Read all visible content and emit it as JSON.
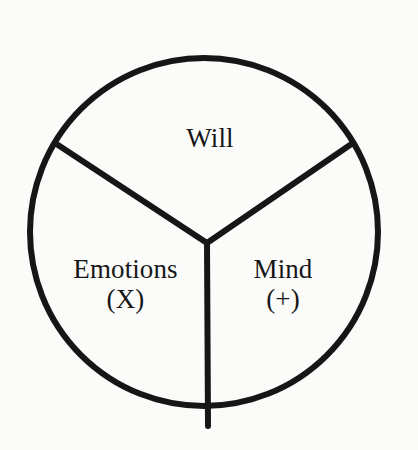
{
  "figure": {
    "kind": "tripartite-circle-diagram",
    "background_color": "#fbfbfa",
    "stroke_color": "#161616",
    "text_color": "#161616"
  },
  "chart_data": {
    "type": "pie",
    "title": "",
    "subtitle": "",
    "xlabel": "",
    "ylabel": "",
    "legend": "none",
    "grid": false,
    "note": "Circle divided into three equal wedges by a Y-shaped set of three spokes meeting near the center; each wedge is labeled.",
    "categories": [
      "Will",
      "Emotions",
      "Mind"
    ],
    "values": [
      33.3,
      33.3,
      33.3
    ],
    "labels": [
      "Will",
      "Emotions (X)",
      "Mind (+)"
    ],
    "colors": [
      "#fbfbfa",
      "#fbfbfa",
      "#fbfbfa"
    ],
    "slice_start_angles_deg": [
      -120,
      120,
      0
    ],
    "slice_span_deg": [
      120,
      120,
      120
    ]
  },
  "segments": [
    {
      "id": "will",
      "name": "Will",
      "symbol": "",
      "position": "top"
    },
    {
      "id": "emotions",
      "name": "Emotions",
      "symbol": "(X)",
      "position": "lower-left"
    },
    {
      "id": "mind",
      "name": "Mind",
      "symbol": "(+)",
      "position": "lower-right"
    }
  ],
  "geometry": {
    "circle_center_x": 204,
    "circle_center_y": 232,
    "circle_radius": 174,
    "stroke_width": 6,
    "junction_x": 207,
    "junction_y": 243,
    "spoke_upper_left_x": 58,
    "spoke_upper_left_y": 145,
    "spoke_upper_right_x": 350,
    "spoke_upper_right_y": 145,
    "spoke_bottom_x": 208,
    "spoke_bottom_y": 426
  }
}
